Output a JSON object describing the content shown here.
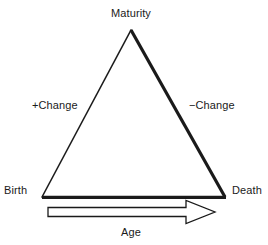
{
  "figure": {
    "type": "diagram",
    "subtype": "life-cycle-triangle",
    "background_color": "#ffffff",
    "ink_color": "#1a1a1a"
  },
  "labels": {
    "apex": "Maturity",
    "left_side": "+Change",
    "right_side": "−Change",
    "bottom_left": "Birth",
    "bottom_right": "Death",
    "axis": "Age"
  },
  "triangle": {
    "apex": {
      "x": 131,
      "y": 30
    },
    "bottom_left": {
      "x": 42,
      "y": 197
    },
    "bottom_right": {
      "x": 225,
      "y": 197
    },
    "stroke_color": "#1a1a1a",
    "fill": "none",
    "left_edge_width": 1.5,
    "right_edge_width": 3.2,
    "bottom_edge_width": 3.2
  },
  "arrow": {
    "direction": "right",
    "style": "hollow-block-arrow",
    "fill": "#ffffff",
    "stroke_color": "#1a1a1a",
    "stroke_width": 1.2,
    "shaft": {
      "x_start": 48,
      "x_end": 186,
      "y_top": 207,
      "y_bottom": 217
    },
    "head": {
      "x_tip": 215,
      "y_top": 200,
      "y_bottom": 224
    }
  }
}
